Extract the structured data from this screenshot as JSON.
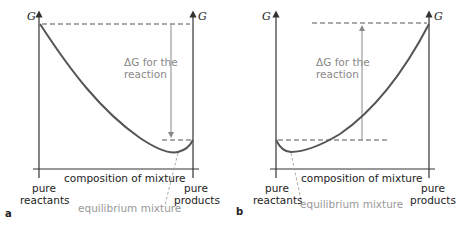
{
  "panels": [
    {
      "id": "a",
      "panel_label": "a",
      "y_axis_label_left": "G",
      "y_axis_label_right": "G",
      "delta_g_line1": "ΔG for the",
      "delta_g_line2": "reaction",
      "x_axis_label": "composition of mixture",
      "left_label_line1": "pure",
      "left_label_line2": "reactants",
      "right_label_line1": "pure",
      "right_label_line2": "products",
      "equilibrium_label": "equilibrium mixture",
      "arrow_direction": "down"
    },
    {
      "id": "b",
      "panel_label": "b",
      "y_axis_label_left": "G",
      "y_axis_label_right": "G",
      "delta_g_line1": "ΔG for the",
      "delta_g_line2": "reaction",
      "x_axis_label": "composition of mixture",
      "left_label_line1": "pure",
      "left_label_line2": "reactants",
      "right_label_line1": "pure",
      "right_label_line2": "products",
      "equilibrium_label": "equilibrium mixture",
      "arrow_direction": "up"
    }
  ],
  "colors": {
    "axis": "#333333",
    "curve": "#555555",
    "annotation_gray": "#999999"
  }
}
